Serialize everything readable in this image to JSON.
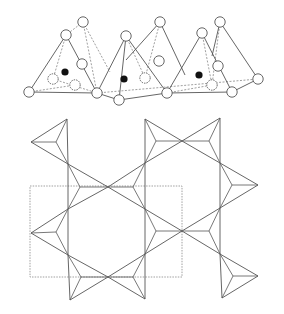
{
  "figure": {
    "colors": {
      "line": "#555555",
      "dashed": "#888888",
      "atom_fill": "#ffffff",
      "cation_fill": "#111111",
      "background": "#ffffff"
    },
    "side_view": {
      "oxygens": [
        [
          83,
          22
        ],
        [
          66,
          35
        ],
        [
          82,
          64
        ],
        [
          29,
          92
        ],
        [
          97,
          93
        ],
        [
          53,
          79
        ],
        [
          75,
          85
        ],
        [
          126,
          36
        ],
        [
          160,
          22
        ],
        [
          119,
          100
        ],
        [
          167,
          93
        ],
        [
          159,
          61
        ],
        [
          145,
          78
        ],
        [
          220,
          22
        ],
        [
          202,
          33
        ],
        [
          218,
          66
        ],
        [
          258,
          79
        ],
        [
          232,
          92
        ],
        [
          212,
          85
        ]
      ],
      "cations": [
        [
          65,
          72
        ],
        [
          124,
          79
        ],
        [
          199,
          75
        ]
      ],
      "solid_edges": [
        [
          [
            66,
            35
          ],
          [
            29,
            92
          ]
        ],
        [
          [
            66,
            35
          ],
          [
            97,
            93
          ]
        ],
        [
          [
            29,
            92
          ],
          [
            97,
            93
          ]
        ],
        [
          [
            126,
            36
          ],
          [
            97,
            93
          ]
        ],
        [
          [
            126,
            36
          ],
          [
            167,
            93
          ]
        ],
        [
          [
            126,
            36
          ],
          [
            119,
            100
          ]
        ],
        [
          [
            97,
            93
          ],
          [
            119,
            100
          ]
        ],
        [
          [
            119,
            100
          ],
          [
            167,
            93
          ]
        ],
        [
          [
            160,
            22
          ],
          [
            126,
            60
          ]
        ],
        [
          [
            160,
            22
          ],
          [
            185,
            75
          ]
        ],
        [
          [
            202,
            33
          ],
          [
            167,
            93
          ]
        ],
        [
          [
            202,
            33
          ],
          [
            232,
            92
          ]
        ],
        [
          [
            167,
            93
          ],
          [
            232,
            92
          ]
        ],
        [
          [
            220,
            22
          ],
          [
            258,
            79
          ]
        ],
        [
          [
            220,
            22
          ],
          [
            212,
            56
          ]
        ],
        [
          [
            232,
            92
          ],
          [
            258,
            79
          ]
        ]
      ],
      "dashed_edges": [
        [
          [
            83,
            22
          ],
          [
            66,
            35
          ]
        ],
        [
          [
            83,
            22
          ],
          [
            97,
            93
          ]
        ],
        [
          [
            83,
            22
          ],
          [
            110,
            72
          ]
        ],
        [
          [
            66,
            35
          ],
          [
            53,
            79
          ]
        ],
        [
          [
            53,
            79
          ],
          [
            97,
            93
          ]
        ],
        [
          [
            29,
            92
          ],
          [
            75,
            85
          ]
        ],
        [
          [
            160,
            22
          ],
          [
            145,
            78
          ]
        ],
        [
          [
            97,
            93
          ],
          [
            258,
            79
          ]
        ],
        [
          [
            126,
            36
          ],
          [
            145,
            78
          ]
        ],
        [
          [
            202,
            33
          ],
          [
            212,
            85
          ]
        ],
        [
          [
            220,
            22
          ],
          [
            212,
            85
          ]
        ],
        [
          [
            167,
            93
          ],
          [
            212,
            85
          ]
        ]
      ]
    },
    "plan_view": {
      "triangles": [
        {
          "v": [
            [
              67,
              119
            ],
            [
              31,
              142
            ],
            [
              68,
              164
            ]
          ],
          "c": [
            56,
            142
          ]
        },
        {
          "v": [
            [
              68,
              164
            ],
            [
              108,
              187
            ],
            [
              68,
              209
            ]
          ],
          "c": [
            80,
            187
          ]
        },
        {
          "v": [
            [
              108,
              187
            ],
            [
              145,
              163
            ],
            [
              145,
              209
            ]
          ],
          "c": [
            133,
            187
          ]
        },
        {
          "v": [
            [
              145,
              119
            ],
            [
              182,
              141
            ],
            [
              145,
              163
            ]
          ],
          "c": [
            156,
            141
          ]
        },
        {
          "v": [
            [
              182,
              141
            ],
            [
              220,
              118
            ],
            [
              220,
              163
            ]
          ],
          "c": [
            209,
            141
          ]
        },
        {
          "v": [
            [
              220,
              163
            ],
            [
              258,
              185
            ],
            [
              220,
              208
            ]
          ],
          "c": [
            232,
            185
          ]
        },
        {
          "v": [
            [
              68,
              209
            ],
            [
              31,
              233
            ],
            [
              68,
              255
            ]
          ],
          "c": [
            56,
            232
          ]
        },
        {
          "v": [
            [
              145,
              209
            ],
            [
              182,
              231
            ],
            [
              145,
              254
            ]
          ],
          "c": [
            156,
            231
          ]
        },
        {
          "v": [
            [
              182,
              231
            ],
            [
              220,
              208
            ],
            [
              220,
              254
            ]
          ],
          "c": [
            209,
            231
          ]
        },
        {
          "v": [
            [
              68,
              255
            ],
            [
              108,
              277
            ],
            [
              70,
              300
            ]
          ],
          "c": [
            81,
            277
          ]
        },
        {
          "v": [
            [
              108,
              277
            ],
            [
              145,
              254
            ],
            [
              145,
              299
            ]
          ],
          "c": [
            133,
            277
          ]
        },
        {
          "v": [
            [
              220,
              254
            ],
            [
              258,
              276
            ],
            [
              222,
              298
            ]
          ],
          "c": [
            233,
            276
          ]
        }
      ],
      "unit_cell": {
        "x": 30,
        "y": 186,
        "width": 152,
        "height": 91
      }
    }
  }
}
